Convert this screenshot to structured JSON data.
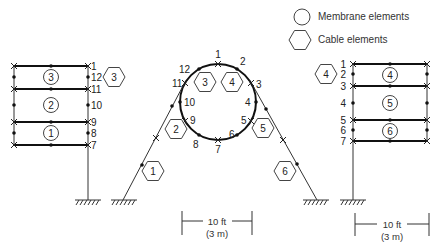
{
  "legend": {
    "membrane": "Membrane elements",
    "cable": "Cable elements"
  },
  "left_frame": {
    "node_labels": [
      "1",
      "12",
      "11",
      "10",
      "9",
      "8",
      "7"
    ],
    "membrane_ids": [
      "3",
      "2",
      "1"
    ],
    "cable_id": "3"
  },
  "center_frame": {
    "node_labels": [
      "1",
      "2",
      "3",
      "4",
      "5",
      "6",
      "7",
      "8",
      "9",
      "10",
      "11",
      "12"
    ],
    "cable_ids": [
      "1",
      "2",
      "3",
      "4",
      "5",
      "6"
    ]
  },
  "right_frame": {
    "node_labels": [
      "1",
      "2",
      "3",
      "4",
      "5",
      "6",
      "7"
    ],
    "membrane_ids": [
      "4",
      "5",
      "6"
    ],
    "cable_id": "4"
  },
  "scale_center": {
    "imperial": "10 ft",
    "metric": "(3 m)"
  },
  "scale_right": {
    "imperial": "10 ft",
    "metric": "(3 m)"
  }
}
